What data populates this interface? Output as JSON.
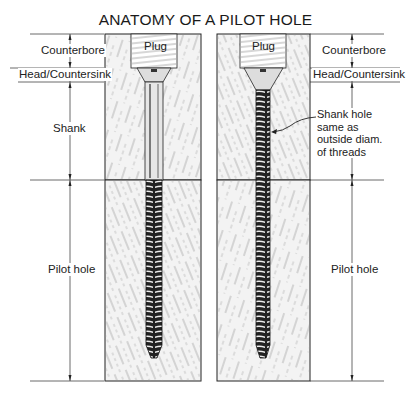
{
  "title": "ANATOMY OF A PILOT HOLE",
  "left": {
    "labels": {
      "counterbore": "Counterbore",
      "head": "Head/Countersink",
      "shank": "Shank",
      "pilot": "Pilot hole"
    },
    "plug": "Plug"
  },
  "right": {
    "labels": {
      "counterbore": "Counterbore",
      "head": "Head/Countersink",
      "pilot": "Pilot hole"
    },
    "plug": "Plug",
    "callout": [
      "Shank hole",
      "same as",
      "outside diam.",
      "of threads"
    ]
  }
}
